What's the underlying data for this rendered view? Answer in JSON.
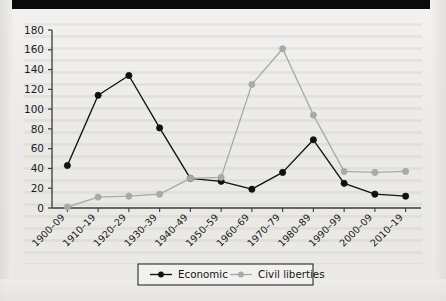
{
  "chart_data": {
    "type": "line",
    "title": "",
    "subtitle": "",
    "xlabel": "",
    "ylabel": "",
    "categories": [
      "1900–09",
      "1910–19",
      "1920–29",
      "1930–39",
      "1940–49",
      "1950–59",
      "1960–69",
      "1970–79",
      "1980–89",
      "1990–99",
      "2000–09",
      "2010–19"
    ],
    "series": [
      {
        "name": "Economic",
        "color": "#111111",
        "marker": "circle",
        "values": [
          43,
          114,
          134,
          81,
          30,
          27,
          19,
          36,
          69,
          25,
          14,
          12
        ]
      },
      {
        "name": "Civil liberties",
        "color": "#a9a9a9",
        "marker": "circle",
        "values": [
          1,
          11,
          12,
          14,
          30,
          31,
          125,
          161,
          94,
          37,
          36,
          37
        ]
      }
    ],
    "ylim": [
      0,
      180
    ],
    "ytick_step": 20,
    "yticks": [
      "0",
      "20",
      "40",
      "60",
      "80",
      "100",
      "120",
      "140",
      "160",
      "180"
    ],
    "grid": false,
    "legend_position": "bottom",
    "axis_color": "#3a3a3a"
  },
  "legend": {
    "items": [
      {
        "label": "Economic",
        "color": "#111111"
      },
      {
        "label": "Civil liberties",
        "color": "#a9a9a9"
      }
    ]
  },
  "colors": {
    "economic": "#111111",
    "civil_liberties": "#a9a9a9",
    "axis": "#3a3a3a",
    "page_background": "#efeeec",
    "scan_band": "#0b0b0b"
  }
}
